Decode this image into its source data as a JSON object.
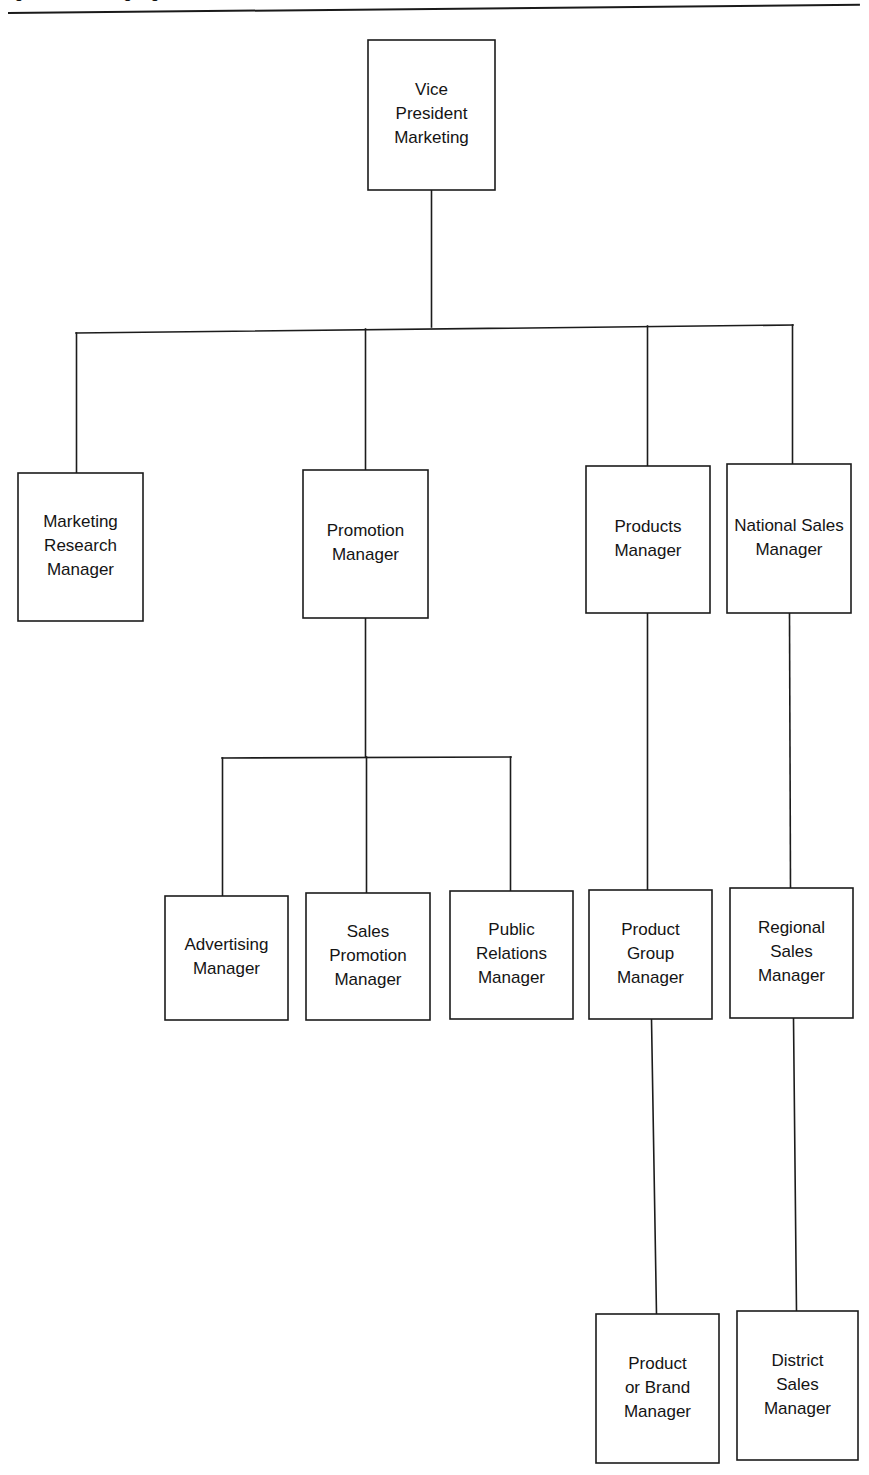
{
  "figure": {
    "caption": "Figure   A marketing organization",
    "rule_color": "#1a1a1a"
  },
  "chart_data": {
    "type": "diagram",
    "diagram_kind": "organization-chart",
    "title": "A marketing organization",
    "orientation": "top-down",
    "box_fill": "#ffffff",
    "box_stroke": "#1c1c1c",
    "line_color": "#1c1c1c",
    "text_color": "#141414",
    "levels": [
      {
        "level": 1,
        "nodes": [
          "vice-president-marketing"
        ]
      },
      {
        "level": 2,
        "nodes": [
          "marketing-research-manager",
          "promotion-manager",
          "products-manager",
          "national-sales-manager"
        ]
      },
      {
        "level": 3,
        "nodes": [
          "advertising-manager",
          "sales-promotion-manager",
          "public-relations-manager",
          "product-group-manager",
          "regional-sales-manager"
        ]
      },
      {
        "level": 4,
        "nodes": [
          "product-or-brand-manager",
          "district-sales-manager"
        ]
      }
    ],
    "nodes": [
      {
        "id": "vice-president-marketing",
        "lines": [
          "Vice",
          "President",
          "Marketing"
        ],
        "x": 368,
        "y": 40,
        "w": 127,
        "h": 150,
        "level": 1,
        "parent": null
      },
      {
        "id": "marketing-research-manager",
        "lines": [
          "Marketing",
          "Research",
          "Manager"
        ],
        "x": 18,
        "y": 473,
        "w": 125,
        "h": 148,
        "level": 2,
        "parent": "vice-president-marketing"
      },
      {
        "id": "promotion-manager",
        "lines": [
          "Promotion",
          "Manager"
        ],
        "x": 303,
        "y": 470,
        "w": 125,
        "h": 148,
        "level": 2,
        "parent": "vice-president-marketing"
      },
      {
        "id": "products-manager",
        "lines": [
          "Products",
          "Manager"
        ],
        "x": 586,
        "y": 466,
        "w": 124,
        "h": 147,
        "level": 2,
        "parent": "vice-president-marketing"
      },
      {
        "id": "national-sales-manager",
        "lines": [
          "National Sales",
          "Manager"
        ],
        "x": 727,
        "y": 464,
        "w": 124,
        "h": 149,
        "level": 2,
        "parent": "vice-president-marketing"
      },
      {
        "id": "advertising-manager",
        "lines": [
          "Advertising",
          "Manager"
        ],
        "x": 165,
        "y": 896,
        "w": 123,
        "h": 124,
        "level": 3,
        "parent": "promotion-manager"
      },
      {
        "id": "sales-promotion-manager",
        "lines": [
          "Sales",
          "Promotion",
          "Manager"
        ],
        "x": 306,
        "y": 893,
        "w": 124,
        "h": 127,
        "level": 3,
        "parent": "promotion-manager"
      },
      {
        "id": "public-relations-manager",
        "lines": [
          "Public",
          "Relations",
          "Manager"
        ],
        "x": 450,
        "y": 891,
        "w": 123,
        "h": 128,
        "level": 3,
        "parent": "promotion-manager"
      },
      {
        "id": "product-group-manager",
        "lines": [
          "Product",
          "Group",
          "Manager"
        ],
        "x": 589,
        "y": 890,
        "w": 123,
        "h": 129,
        "level": 3,
        "parent": "products-manager"
      },
      {
        "id": "regional-sales-manager",
        "lines": [
          "Regional",
          "Sales",
          "Manager"
        ],
        "x": 730,
        "y": 888,
        "w": 123,
        "h": 130,
        "level": 3,
        "parent": "national-sales-manager"
      },
      {
        "id": "product-or-brand-manager",
        "lines": [
          "Product",
          "or Brand",
          "Manager"
        ],
        "x": 596,
        "y": 1314,
        "w": 123,
        "h": 149,
        "level": 4,
        "parent": "product-group-manager"
      },
      {
        "id": "district-sales-manager",
        "lines": [
          "District",
          "Sales",
          "Manager"
        ],
        "x": 737,
        "y": 1311,
        "w": 121,
        "h": 149,
        "level": 4,
        "parent": "regional-sales-manager"
      }
    ],
    "edges": [
      {
        "from": "vice-president-marketing",
        "to": "marketing-research-manager",
        "style": "bus"
      },
      {
        "from": "vice-president-marketing",
        "to": "promotion-manager",
        "style": "bus"
      },
      {
        "from": "vice-president-marketing",
        "to": "products-manager",
        "style": "bus"
      },
      {
        "from": "vice-president-marketing",
        "to": "national-sales-manager",
        "style": "bus"
      },
      {
        "from": "promotion-manager",
        "to": "advertising-manager",
        "style": "bus"
      },
      {
        "from": "promotion-manager",
        "to": "sales-promotion-manager",
        "style": "bus"
      },
      {
        "from": "promotion-manager",
        "to": "public-relations-manager",
        "style": "bus"
      },
      {
        "from": "products-manager",
        "to": "product-group-manager",
        "style": "straight"
      },
      {
        "from": "national-sales-manager",
        "to": "regional-sales-manager",
        "style": "straight"
      },
      {
        "from": "product-group-manager",
        "to": "product-or-brand-manager",
        "style": "straight"
      },
      {
        "from": "regional-sales-manager",
        "to": "district-sales-manager",
        "style": "straight"
      }
    ]
  }
}
